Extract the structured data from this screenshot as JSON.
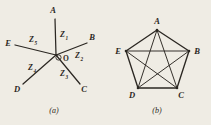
{
  "figure": {
    "background_color": "#efece4",
    "ink_color": "#2b2722",
    "width": 211,
    "height": 125
  },
  "panels": [
    {
      "id": "a",
      "caption": "(a)",
      "type": "star-wye-network",
      "center": {
        "label": "O",
        "x": 56,
        "y": 55
      },
      "nodes": [
        {
          "label": "A",
          "x": 53,
          "y": 13,
          "tip_x": 55,
          "tip_y": 19
        },
        {
          "label": "B",
          "x": 92,
          "y": 40,
          "tip_x": 87,
          "tip_y": 43
        },
        {
          "label": "C",
          "x": 84,
          "y": 89,
          "tip_x": 80,
          "tip_y": 84
        },
        {
          "label": "D",
          "x": 17,
          "y": 89,
          "tip_x": 23,
          "tip_y": 84
        },
        {
          "label": "E",
          "x": 8,
          "y": 43,
          "tip_x": 15,
          "tip_y": 45
        }
      ],
      "impedances": [
        {
          "symbol": "Z",
          "subscript": "1",
          "x": 60,
          "y": 36
        },
        {
          "symbol": "Z",
          "subscript": "2",
          "x": 76,
          "y": 57
        },
        {
          "symbol": "Z",
          "subscript": "3",
          "x": 62,
          "y": 75
        },
        {
          "symbol": "Z",
          "subscript": "4",
          "x": 30,
          "y": 69
        },
        {
          "symbol": "Z",
          "subscript": "5",
          "x": 31,
          "y": 41
        }
      ]
    },
    {
      "id": "b",
      "caption": "(b)",
      "type": "complete-graph-mesh-delta",
      "nodes": [
        {
          "label": "A",
          "x": 157,
          "y": 30,
          "label_x": 157,
          "label_y": 21
        },
        {
          "label": "B",
          "x": 189,
          "y": 51,
          "label_x": 197,
          "label_y": 51
        },
        {
          "label": "C",
          "x": 177,
          "y": 88,
          "label_x": 182,
          "label_y": 96
        },
        {
          "label": "D",
          "x": 138,
          "y": 88,
          "label_x": 131,
          "label_y": 96
        },
        {
          "label": "E",
          "x": 126,
          "y": 51,
          "label_x": 118,
          "label_y": 51
        }
      ],
      "perimeter_edges": [
        [
          "A",
          "B"
        ],
        [
          "B",
          "C"
        ],
        [
          "C",
          "D"
        ],
        [
          "D",
          "E"
        ],
        [
          "E",
          "A"
        ]
      ],
      "diagonal_edges": [
        [
          "A",
          "C"
        ],
        [
          "A",
          "D"
        ],
        [
          "B",
          "D"
        ],
        [
          "B",
          "E"
        ],
        [
          "C",
          "E"
        ]
      ]
    }
  ]
}
